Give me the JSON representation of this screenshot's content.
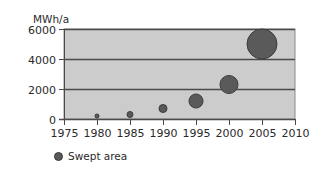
{
  "chart_data": {
    "type": "scatter",
    "subtype": "bubble",
    "title": "",
    "xlabel": "",
    "ylabel": "MWh/a",
    "xlim": [
      1975,
      2010
    ],
    "ylim": [
      0,
      6000
    ],
    "x_ticks": [
      1975,
      1980,
      1985,
      1990,
      1995,
      2000,
      2005,
      2010
    ],
    "y_ticks": [
      0,
      2000,
      4000,
      6000
    ],
    "grid": {
      "horizontal": true,
      "vertical": false
    },
    "legend_position": "bottom-left",
    "series": [
      {
        "name": "Swept area",
        "x": [
          1980,
          1985,
          1990,
          1995,
          2000,
          2005
        ],
        "values": [
          200,
          300,
          700,
          1200,
          2300,
          5000
        ],
        "bubble_radius_px": [
          2,
          3,
          4,
          7,
          9,
          15
        ]
      }
    ]
  },
  "colors": {
    "plot_background": "#cccccc",
    "gridline": "#4a4a4a",
    "bubble_fill": "#5a5a5a",
    "bubble_stroke": "#3a3a3a",
    "axis": "#4a4a4a"
  },
  "legend": {
    "label": "Swept area"
  },
  "axis": {
    "y_unit": "MWh/a"
  }
}
